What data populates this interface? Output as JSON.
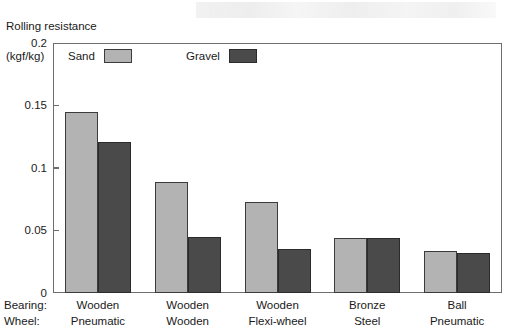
{
  "chart_data": {
    "type": "bar",
    "title": "",
    "ylabel": "Rolling resistance (kgf/kg)",
    "ylabel_lines": [
      "Rolling resistance",
      "(kgf/kg)"
    ],
    "xlabel": "",
    "ylim": [
      0,
      0.2
    ],
    "ytick_values": [
      0,
      0.05,
      0.1,
      0.15,
      0.2
    ],
    "ytick_labels": [
      "0",
      "0.05",
      "0.1",
      "0.15",
      "0.2"
    ],
    "grid": false,
    "legend_position": "inside-top-left",
    "categories": [
      "Wooden Pneumatic",
      "Wooden Wooden",
      "Wooden Flexi-wheel",
      "Bronze Steel",
      "Ball Pneumatic"
    ],
    "category_rows": [
      {
        "header": "Bearing:",
        "values": [
          "Wooden",
          "Wooden",
          "Wooden",
          "Bronze",
          "Ball"
        ]
      },
      {
        "header": "Wheel:",
        "values": [
          "Pneumatic",
          "Wooden",
          "Flexi-wheel",
          "Steel",
          "Pneumatic"
        ]
      }
    ],
    "series": [
      {
        "name": "Sand",
        "color": "#b3b3b3",
        "values": [
          0.145,
          0.089,
          0.073,
          0.044,
          0.034
        ]
      },
      {
        "name": "Gravel",
        "color": "#4a4a4a",
        "values": [
          0.121,
          0.045,
          0.035,
          0.044,
          0.032
        ]
      }
    ]
  }
}
